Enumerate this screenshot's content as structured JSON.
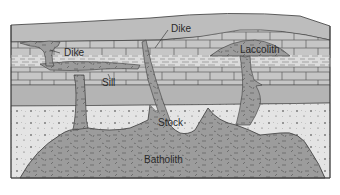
{
  "diagram": {
    "labels": {
      "dike_left": "Dike",
      "dike_top": "Dike",
      "sill": "Sill",
      "laccolith": "Laccolith",
      "stock": "Stock",
      "batholith": "Batholith"
    },
    "colors": {
      "background": "#ffffff",
      "surface_layer": "#b9b9b9",
      "brick_layer": "#c4c4c4",
      "shale_layer": "#d6d6d6",
      "mid_gray_layer": "#b0b0b0",
      "sand_layer": "#e2e2e2",
      "intrusion": "#9a9a9a",
      "outline": "#3a3a3a",
      "label_text": "#2a2a2a"
    },
    "layers": [
      "surface",
      "limestone-upper",
      "shale",
      "limestone-lower",
      "gray-stratum",
      "sandstone",
      "batholith"
    ]
  }
}
